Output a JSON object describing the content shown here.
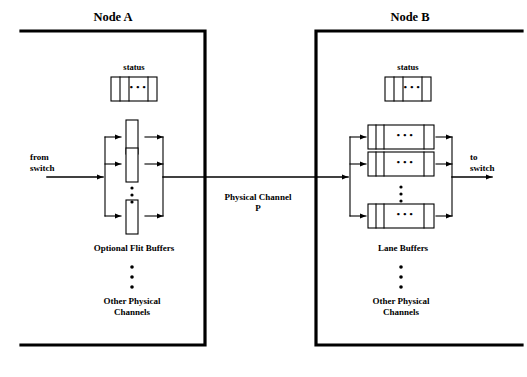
{
  "diagram": {
    "title_a": "Node A",
    "title_b": "Node B",
    "channel_label_line1": "Physical Channel",
    "channel_label_line2": "P",
    "vertical_ellipsis": "•\n•\n•"
  },
  "node_a": {
    "title": "Node A",
    "status_label": "status",
    "status_cells_ellipsis": "• • •",
    "input_label_line1": "from",
    "input_label_line2": "switch",
    "buffers_label": "Optional Flit Buffers",
    "ellipsis_dots": "•",
    "other_label_line1": "Other Physical",
    "other_label_line2": "Channels",
    "buffer_count_visible": 3,
    "buffer_style": "vertical-slot"
  },
  "node_b": {
    "title": "Node B",
    "status_label": "status",
    "status_cells_ellipsis": "• • •",
    "output_label_line1": "to",
    "output_label_line2": "switch",
    "buffers_label": "Lane Buffers",
    "ellipsis_dots": "•",
    "other_label_line1": "Other Physical",
    "other_label_line2": "Channels",
    "buffer_count_visible": 3,
    "buffer_style": "horizontal-fifo",
    "fifo_ellipsis": "• • •"
  },
  "colors": {
    "stroke": "#000000",
    "background": "#ffffff",
    "text": "#000000"
  }
}
